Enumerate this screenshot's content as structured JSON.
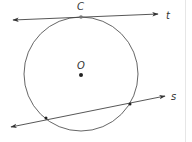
{
  "diagram": {
    "colors": {
      "stroke": "#444444",
      "point": "#222222",
      "label": "#333333",
      "background": "#ffffff"
    },
    "circle": {
      "center_label": "O",
      "cx": 81,
      "cy": 74,
      "r": 57
    },
    "points": [
      {
        "name": "C",
        "label": "C",
        "x": 81,
        "y": 17,
        "role": "point of tangency"
      },
      {
        "name": "O",
        "label": "O",
        "x": 81,
        "y": 75,
        "role": "center"
      },
      {
        "name": "s-intersection-1",
        "label": "",
        "x": 46,
        "y": 118
      },
      {
        "name": "s-intersection-2",
        "label": "",
        "x": 130,
        "y": 104
      }
    ],
    "lines": [
      {
        "name": "t",
        "label": "t",
        "type": "tangent",
        "x1": 13,
        "y1": 20,
        "x2": 158,
        "y2": 14
      },
      {
        "name": "s",
        "label": "s",
        "type": "secant",
        "x1": 11,
        "y1": 127,
        "x2": 165,
        "y2": 96
      }
    ],
    "labels": {
      "C": "C",
      "O": "O",
      "t": "t",
      "s": "s"
    }
  }
}
